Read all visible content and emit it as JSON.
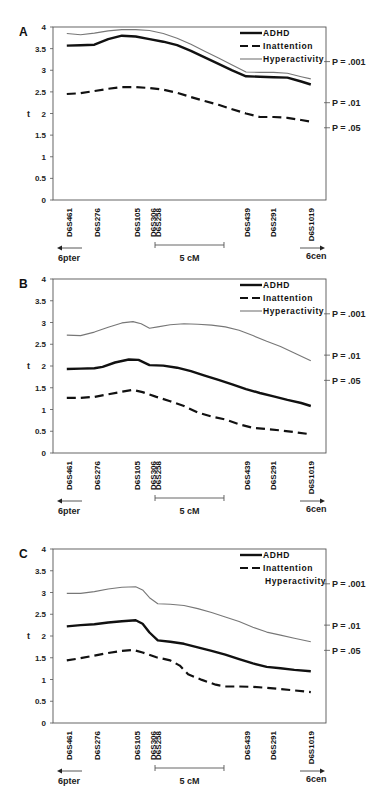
{
  "chart_data": [
    {
      "type": "line",
      "panel_label": "A",
      "ylabel": "t",
      "ylim": [
        0,
        4
      ],
      "yticks": [
        "0",
        "0.5",
        "1",
        "1.5",
        "2",
        "2.5",
        "3",
        "3.5",
        "4"
      ],
      "x_unit": "cM",
      "xlim": [
        0,
        19.8
      ],
      "markers": [
        {
          "name": "D6S461",
          "pos": 1.15
        },
        {
          "name": "D6S276",
          "pos": 3.2
        },
        {
          "name": "D6S105",
          "pos": 6.1
        },
        {
          "name": "D6S306",
          "pos": 7.25
        },
        {
          "name": "D6S258",
          "pos": 7.6
        },
        {
          "name": "D6S439",
          "pos": 14.1
        },
        {
          "name": "D6S291",
          "pos": 15.95
        },
        {
          "name": "D6S1019",
          "pos": 18.7
        }
      ],
      "significance": [
        {
          "label": "P = .001",
          "t": 3.2
        },
        {
          "label": "P = .01",
          "t": 2.25
        },
        {
          "label": "P = .05",
          "t": 1.67
        }
      ],
      "scale_bar": {
        "label": "5 cM",
        "from": 7.4,
        "to": 12.4
      },
      "left_arrow": "6pter",
      "right_arrow": "6cen",
      "legend": [
        {
          "name": "ADHD",
          "style": "solid-thick",
          "show_sample": true
        },
        {
          "name": "Inattention",
          "style": "dashed",
          "show_sample": true
        },
        {
          "name": "Hyperactivity",
          "style": "solid-thin",
          "show_sample": true
        }
      ],
      "series": [
        {
          "name": "ADHD",
          "points": [
            [
              1.0,
              3.57
            ],
            [
              2.0,
              3.58
            ],
            [
              3.0,
              3.59
            ],
            [
              4.0,
              3.72
            ],
            [
              5.0,
              3.8
            ],
            [
              6.0,
              3.78
            ],
            [
              7.0,
              3.72
            ],
            [
              8.0,
              3.66
            ],
            [
              9.0,
              3.58
            ],
            [
              10.0,
              3.45
            ],
            [
              11.0,
              3.3
            ],
            [
              12.0,
              3.15
            ],
            [
              13.0,
              3.0
            ],
            [
              14.0,
              2.86
            ],
            [
              15.0,
              2.85
            ],
            [
              16.0,
              2.84
            ],
            [
              17.0,
              2.83
            ],
            [
              18.0,
              2.74
            ],
            [
              18.7,
              2.67
            ]
          ]
        },
        {
          "name": "Inattention",
          "points": [
            [
              1.0,
              2.45
            ],
            [
              2.0,
              2.47
            ],
            [
              3.0,
              2.52
            ],
            [
              4.0,
              2.57
            ],
            [
              5.0,
              2.61
            ],
            [
              6.0,
              2.61
            ],
            [
              7.0,
              2.59
            ],
            [
              8.0,
              2.55
            ],
            [
              9.0,
              2.48
            ],
            [
              10.0,
              2.38
            ],
            [
              11.0,
              2.29
            ],
            [
              12.0,
              2.2
            ],
            [
              13.0,
              2.1
            ],
            [
              14.0,
              2.0
            ],
            [
              15.0,
              1.92
            ],
            [
              16.0,
              1.92
            ],
            [
              17.0,
              1.9
            ],
            [
              18.0,
              1.85
            ],
            [
              18.7,
              1.81
            ]
          ]
        },
        {
          "name": "Hyperactivity",
          "points": [
            [
              1.0,
              3.85
            ],
            [
              2.0,
              3.82
            ],
            [
              3.0,
              3.86
            ],
            [
              4.0,
              3.91
            ],
            [
              5.0,
              3.94
            ],
            [
              6.0,
              3.94
            ],
            [
              7.0,
              3.92
            ],
            [
              8.0,
              3.85
            ],
            [
              9.0,
              3.74
            ],
            [
              10.0,
              3.6
            ],
            [
              11.0,
              3.44
            ],
            [
              12.0,
              3.28
            ],
            [
              13.0,
              3.12
            ],
            [
              14.0,
              2.96
            ],
            [
              15.0,
              2.95
            ],
            [
              16.0,
              2.95
            ],
            [
              17.0,
              2.93
            ],
            [
              18.0,
              2.85
            ],
            [
              18.7,
              2.8
            ]
          ]
        }
      ]
    },
    {
      "type": "line",
      "panel_label": "B",
      "ylabel": "t",
      "ylim": [
        0,
        4
      ],
      "yticks": [
        "0",
        "0.5",
        "1",
        "1.5",
        "2",
        "2.5",
        "3",
        "3.5",
        "4"
      ],
      "x_unit": "cM",
      "xlim": [
        0,
        19.8
      ],
      "markers": [
        {
          "name": "D6S461",
          "pos": 1.15
        },
        {
          "name": "D6S276",
          "pos": 3.2
        },
        {
          "name": "D6S105",
          "pos": 6.1
        },
        {
          "name": "D6S306",
          "pos": 7.25
        },
        {
          "name": "D6S258",
          "pos": 7.6
        },
        {
          "name": "D6S439",
          "pos": 14.1
        },
        {
          "name": "D6S291",
          "pos": 15.95
        },
        {
          "name": "D6S1019",
          "pos": 18.7
        }
      ],
      "significance": [
        {
          "label": "P = .001",
          "t": 3.2
        },
        {
          "label": "P = .01",
          "t": 2.25
        },
        {
          "label": "P = .05",
          "t": 1.67
        }
      ],
      "scale_bar": {
        "label": "5 cM",
        "from": 7.4,
        "to": 12.4
      },
      "left_arrow": "6pter",
      "right_arrow": "6cen",
      "legend": [
        {
          "name": "ADHD",
          "style": "solid-thick",
          "show_sample": true
        },
        {
          "name": "Inattention",
          "style": "dashed",
          "show_sample": true
        },
        {
          "name": "Hyperactivity",
          "style": "solid-thin",
          "show_sample": true
        }
      ],
      "series": [
        {
          "name": "ADHD",
          "points": [
            [
              1.0,
              1.93
            ],
            [
              2.0,
              1.94
            ],
            [
              3.0,
              1.95
            ],
            [
              3.6,
              1.98
            ],
            [
              4.5,
              2.08
            ],
            [
              5.5,
              2.15
            ],
            [
              6.2,
              2.14
            ],
            [
              7.0,
              2.02
            ],
            [
              8.0,
              2.01
            ],
            [
              9.0,
              1.96
            ],
            [
              10.0,
              1.88
            ],
            [
              11.0,
              1.78
            ],
            [
              12.0,
              1.68
            ],
            [
              13.0,
              1.58
            ],
            [
              14.0,
              1.47
            ],
            [
              15.0,
              1.38
            ],
            [
              16.0,
              1.3
            ],
            [
              17.0,
              1.22
            ],
            [
              18.0,
              1.15
            ],
            [
              18.7,
              1.08
            ]
          ]
        },
        {
          "name": "Inattention",
          "points": [
            [
              1.0,
              1.27
            ],
            [
              2.0,
              1.27
            ],
            [
              3.0,
              1.29
            ],
            [
              4.0,
              1.35
            ],
            [
              5.0,
              1.41
            ],
            [
              5.8,
              1.45
            ],
            [
              6.5,
              1.4
            ],
            [
              7.5,
              1.29
            ],
            [
              8.5,
              1.19
            ],
            [
              9.5,
              1.08
            ],
            [
              10.5,
              0.93
            ],
            [
              11.5,
              0.84
            ],
            [
              12.5,
              0.77
            ],
            [
              13.5,
              0.66
            ],
            [
              14.5,
              0.58
            ],
            [
              15.5,
              0.55
            ],
            [
              16.5,
              0.52
            ],
            [
              17.5,
              0.48
            ],
            [
              18.7,
              0.43
            ]
          ]
        },
        {
          "name": "Hyperactivity",
          "points": [
            [
              1.0,
              2.71
            ],
            [
              2.0,
              2.7
            ],
            [
              3.0,
              2.78
            ],
            [
              4.0,
              2.89
            ],
            [
              5.0,
              2.99
            ],
            [
              5.8,
              3.02
            ],
            [
              6.4,
              2.97
            ],
            [
              7.0,
              2.87
            ],
            [
              7.6,
              2.9
            ],
            [
              8.5,
              2.95
            ],
            [
              9.5,
              2.97
            ],
            [
              10.5,
              2.96
            ],
            [
              11.5,
              2.94
            ],
            [
              12.5,
              2.9
            ],
            [
              13.5,
              2.82
            ],
            [
              14.5,
              2.7
            ],
            [
              15.5,
              2.57
            ],
            [
              16.5,
              2.45
            ],
            [
              17.5,
              2.3
            ],
            [
              18.7,
              2.12
            ]
          ]
        }
      ]
    },
    {
      "type": "line",
      "panel_label": "C",
      "ylabel": "t",
      "ylim": [
        0,
        4
      ],
      "yticks": [
        "0",
        "0.5",
        "1",
        "1.5",
        "2",
        "2.5",
        "3",
        "3.5",
        "4"
      ],
      "x_unit": "cM",
      "xlim": [
        0,
        19.8
      ],
      "markers": [
        {
          "name": "D6S461",
          "pos": 1.15
        },
        {
          "name": "D6S276",
          "pos": 3.2
        },
        {
          "name": "D6S105",
          "pos": 6.1
        },
        {
          "name": "D6S306",
          "pos": 7.25
        },
        {
          "name": "D6S258",
          "pos": 7.6
        },
        {
          "name": "D6S439",
          "pos": 14.1
        },
        {
          "name": "D6S291",
          "pos": 15.95
        },
        {
          "name": "D6S1019",
          "pos": 18.7
        }
      ],
      "significance": [
        {
          "label": "P = .001",
          "t": 3.2
        },
        {
          "label": "P = .01",
          "t": 2.25
        },
        {
          "label": "P = .05",
          "t": 1.67
        }
      ],
      "scale_bar": {
        "label": "5 cM",
        "from": 7.4,
        "to": 12.4
      },
      "left_arrow": "6pter",
      "right_arrow": "6cen",
      "legend": [
        {
          "name": "ADHD",
          "style": "solid-thick",
          "show_sample": true
        },
        {
          "name": "Inattention",
          "style": "dashed",
          "show_sample": true
        },
        {
          "name": "Hyperactivity",
          "style": "solid-thin",
          "show_sample": false
        }
      ],
      "series": [
        {
          "name": "ADHD",
          "points": [
            [
              1.0,
              2.22
            ],
            [
              2.0,
              2.25
            ],
            [
              3.0,
              2.27
            ],
            [
              4.0,
              2.31
            ],
            [
              5.0,
              2.34
            ],
            [
              6.0,
              2.36
            ],
            [
              6.5,
              2.28
            ],
            [
              7.0,
              2.08
            ],
            [
              7.6,
              1.9
            ],
            [
              8.5,
              1.87
            ],
            [
              9.5,
              1.82
            ],
            [
              10.5,
              1.74
            ],
            [
              11.5,
              1.66
            ],
            [
              12.5,
              1.57
            ],
            [
              13.5,
              1.47
            ],
            [
              14.5,
              1.37
            ],
            [
              15.5,
              1.29
            ],
            [
              16.5,
              1.26
            ],
            [
              17.5,
              1.22
            ],
            [
              18.7,
              1.19
            ]
          ]
        },
        {
          "name": "Inattention",
          "points": [
            [
              1.0,
              1.44
            ],
            [
              2.0,
              1.49
            ],
            [
              3.0,
              1.55
            ],
            [
              4.0,
              1.61
            ],
            [
              5.0,
              1.66
            ],
            [
              5.8,
              1.68
            ],
            [
              6.5,
              1.62
            ],
            [
              7.5,
              1.51
            ],
            [
              8.5,
              1.44
            ],
            [
              9.2,
              1.32
            ],
            [
              9.8,
              1.12
            ],
            [
              10.8,
              0.99
            ],
            [
              11.8,
              0.88
            ],
            [
              12.5,
              0.84
            ],
            [
              13.5,
              0.84
            ],
            [
              14.5,
              0.83
            ],
            [
              15.5,
              0.81
            ],
            [
              16.5,
              0.78
            ],
            [
              17.5,
              0.75
            ],
            [
              18.7,
              0.71
            ]
          ]
        },
        {
          "name": "Hyperactivity",
          "points": [
            [
              1.0,
              2.98
            ],
            [
              2.0,
              2.98
            ],
            [
              3.0,
              3.02
            ],
            [
              4.0,
              3.08
            ],
            [
              5.0,
              3.12
            ],
            [
              6.0,
              3.13
            ],
            [
              6.5,
              3.06
            ],
            [
              7.0,
              2.88
            ],
            [
              7.6,
              2.74
            ],
            [
              8.5,
              2.73
            ],
            [
              9.5,
              2.7
            ],
            [
              10.5,
              2.63
            ],
            [
              11.5,
              2.54
            ],
            [
              12.5,
              2.44
            ],
            [
              13.5,
              2.33
            ],
            [
              14.5,
              2.2
            ],
            [
              15.5,
              2.09
            ],
            [
              16.5,
              2.02
            ],
            [
              17.5,
              1.95
            ],
            [
              18.7,
              1.87
            ]
          ]
        }
      ]
    }
  ]
}
